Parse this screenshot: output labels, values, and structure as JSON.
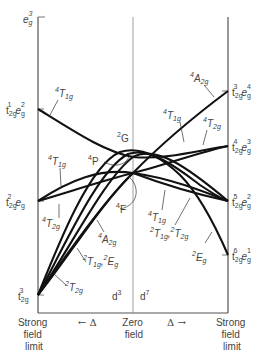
{
  "diagram": {
    "title": "",
    "type": "Tanabe-Sugano / correlation diagram for d3 and d7 octahedral",
    "left_axis_top_label": {
      "base": "e",
      "sub": "g",
      "sup": "3"
    },
    "left_configs": [
      {
        "id": "t2g1eg2",
        "text": "t2g1 eg2",
        "t": "t",
        "t_sub": "2g",
        "t_sup": "1",
        "e": "e",
        "e_sub": "g",
        "e_sup": "2"
      },
      {
        "id": "t2g2eg",
        "text": "t2g2 eg",
        "t": "t",
        "t_sub": "2g",
        "t_sup": "2",
        "e": "e",
        "e_sub": "g",
        "e_sup": ""
      },
      {
        "id": "t2g3",
        "text": "t2g3",
        "t": "t",
        "t_sub": "2g",
        "t_sup": "3"
      }
    ],
    "right_configs": [
      {
        "id": "t2g3eg4",
        "text": "t2g3 eg4",
        "t": "t",
        "t_sub": "2g",
        "t_sup": "3",
        "e": "e",
        "e_sub": "g",
        "e_sup": "4"
      },
      {
        "id": "t2g4eg3",
        "text": "t2g4 eg3",
        "t": "t",
        "t_sub": "2g",
        "t_sup": "4",
        "e": "e",
        "e_sub": "g",
        "e_sup": "3"
      },
      {
        "id": "t2g5eg2",
        "text": "t2g5 eg2",
        "t": "t",
        "t_sub": "2g",
        "t_sup": "5",
        "e": "e",
        "e_sub": "g",
        "e_sup": "2"
      },
      {
        "id": "t2g6eg1",
        "text": "t2g6 eg1",
        "t": "t",
        "t_sub": "2g",
        "t_sup": "6",
        "e": "e",
        "e_sub": "g",
        "e_sup": "1"
      }
    ],
    "free_ion_terms": [
      {
        "id": "2G",
        "sup": "2",
        "base": "G"
      },
      {
        "id": "4P",
        "sup": "4",
        "base": "P"
      },
      {
        "id": "4F",
        "sup": "4",
        "base": "F"
      }
    ],
    "state_labels_left": [
      {
        "id": "4T1g-top",
        "sup": "4",
        "base": "T",
        "sub": "1g"
      },
      {
        "id": "4T1g-mid",
        "sup": "4",
        "base": "T",
        "sub": "1g"
      },
      {
        "id": "4T2g",
        "sup": "4",
        "base": "T",
        "sub": "2g"
      },
      {
        "id": "4A2g",
        "sup": "4",
        "base": "A",
        "sub": "2g"
      },
      {
        "id": "2T1g-2Eg",
        "sup1": "2",
        "base1": "T",
        "sub1": "1g",
        "sep": ",",
        "sup2": "2",
        "base2": "E",
        "sub2": "g"
      },
      {
        "id": "2T2g",
        "sup": "2",
        "base": "T",
        "sub": "2g"
      }
    ],
    "state_labels_right": [
      {
        "id": "4A2g",
        "sup": "4",
        "base": "A",
        "sub": "2g"
      },
      {
        "id": "4T1g-upper",
        "sup": "4",
        "base": "T",
        "sub": "1g"
      },
      {
        "id": "4T2g",
        "sup": "4",
        "base": "T",
        "sub": "2g"
      },
      {
        "id": "4T1g-lower",
        "sup": "4",
        "base": "T",
        "sub": "1g"
      },
      {
        "id": "2T1g-2T2g",
        "sup1": "2",
        "base1": "T",
        "sub1": "1g",
        "sep": ",",
        "sup2": "2",
        "base2": "T",
        "sub2": "2g"
      },
      {
        "id": "2Eg",
        "sup": "2",
        "base": "E",
        "sub": "g"
      }
    ],
    "center_labels": {
      "left": "d",
      "left_sup": "3",
      "right": "d",
      "right_sup": "7"
    },
    "bottom_labels": {
      "left": [
        "Strong",
        "field",
        "limit"
      ],
      "arrow_left": "← Δ",
      "center": [
        "Zero",
        "field"
      ],
      "arrow_right": "Δ →",
      "right": [
        "Strong",
        "field",
        "limit"
      ]
    }
  }
}
